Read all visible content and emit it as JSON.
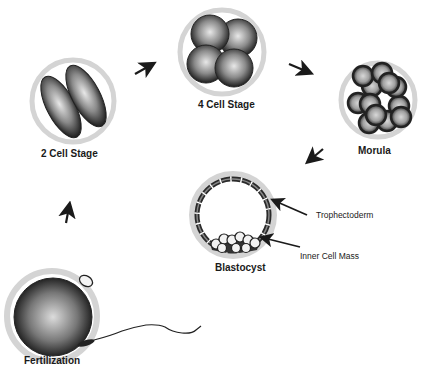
{
  "diagram": {
    "stages": [
      {
        "id": "fertilization",
        "label": "Fertilization"
      },
      {
        "id": "two_cell",
        "label": "2 Cell Stage"
      },
      {
        "id": "four_cell",
        "label": "4 Cell Stage"
      },
      {
        "id": "morula",
        "label": "Morula"
      },
      {
        "id": "blastocyst",
        "label": "Blastocyst"
      }
    ],
    "annotations": {
      "trophectoderm": "Trophectoderm",
      "inner_cell_mass": "Inner Cell Mass"
    },
    "flow": [
      "Fertilization",
      "2 Cell Stage",
      "4 Cell Stage",
      "Morula",
      "Blastocyst"
    ],
    "colors": {
      "ink": "#1a1a1a",
      "zona": "#d9d9d9",
      "cell_light": "#e6e6e6",
      "cell_dark": "#1e1e1e"
    }
  }
}
